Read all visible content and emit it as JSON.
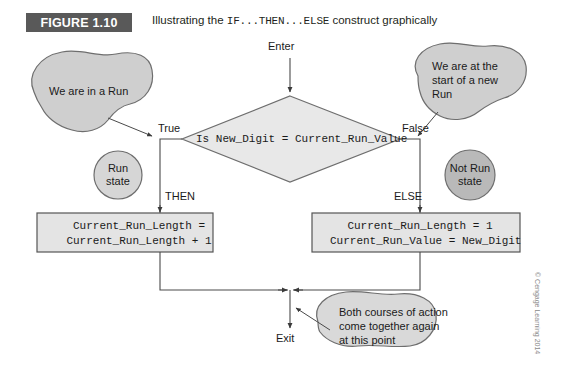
{
  "figure": {
    "label": "FIGURE 1.10",
    "caption_pre": "Illustrating the ",
    "caption_code": "IF...THEN...ELSE",
    "caption_post": " construct graphically",
    "band_color": "#595959"
  },
  "flowchart": {
    "entry_label": "Enter",
    "exit_label": "Exit",
    "decision": {
      "text": "Is New_Digit = Current_Run_Value",
      "true_label": "True",
      "false_label": "False",
      "fill": "#e8e8e8",
      "stroke": "#666666"
    },
    "branches": {
      "then_label": "THEN",
      "else_label": "ELSE"
    },
    "then_box": {
      "line1": "Current_Run_Length =",
      "line2": "Current_Run_Length + 1",
      "fill": "#e4e4e4",
      "stroke": "#555555"
    },
    "else_box": {
      "line1": "Current_Run_Length = 1",
      "line2": "Current_Run_Value = New_Digit",
      "fill": "#e4e4e4",
      "stroke": "#555555"
    },
    "states": {
      "run_state": {
        "line1": "Run",
        "line2": "state",
        "fill": "#d6d6d6"
      },
      "not_run_state": {
        "line1": "Not Run",
        "line2": "state",
        "fill": "#b9b9b9"
      }
    },
    "callouts": {
      "left": {
        "line1": "We are in a Run",
        "fill": "#cfcfcf"
      },
      "right": {
        "line1": "We are at the",
        "line2": "start of a new",
        "line3": "Run",
        "fill": "#cfcfcf"
      },
      "bottom": {
        "line1": "Both courses of action",
        "line2": "come together again",
        "line3": "at this point",
        "fill": "#d9d9d9"
      }
    }
  },
  "credit": "© Cengage Learning 2014"
}
